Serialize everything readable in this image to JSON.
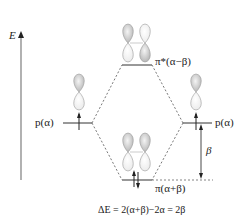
{
  "diagram": {
    "type": "molecular-orbital-energy-diagram",
    "axis": {
      "label": "E",
      "direction": "up"
    },
    "levels": [
      {
        "id": "p-left",
        "label": "p(α)",
        "electrons": 1,
        "spin": [
          "up"
        ]
      },
      {
        "id": "p-right",
        "label": "p(α)",
        "electrons": 1,
        "spin": [
          "up"
        ]
      },
      {
        "id": "pi-star",
        "label": "π*(α−β)",
        "electrons": 0,
        "kind": "antibonding"
      },
      {
        "id": "pi",
        "label": "π(α+β)",
        "electrons": 2,
        "spin": [
          "up",
          "down"
        ],
        "kind": "bonding"
      }
    ],
    "gap_label": "β",
    "equation": "ΔE = 2(α+β)−2α = 2β"
  },
  "labels": {
    "axis_E": "E",
    "p_left": "p(α)",
    "p_right": "p(α)",
    "pi_star": "π*(α−β)",
    "pi": "π(α+β)",
    "beta": "β",
    "delta_E": "ΔE = 2(α+β)−2α = 2β"
  },
  "colors": {
    "line": "#333333",
    "dashed": "#555555",
    "orbital_fill_dark": "#c8c8c8",
    "orbital_fill_light": "#f2f2f2",
    "orbital_stroke": "#9a9a9a"
  }
}
